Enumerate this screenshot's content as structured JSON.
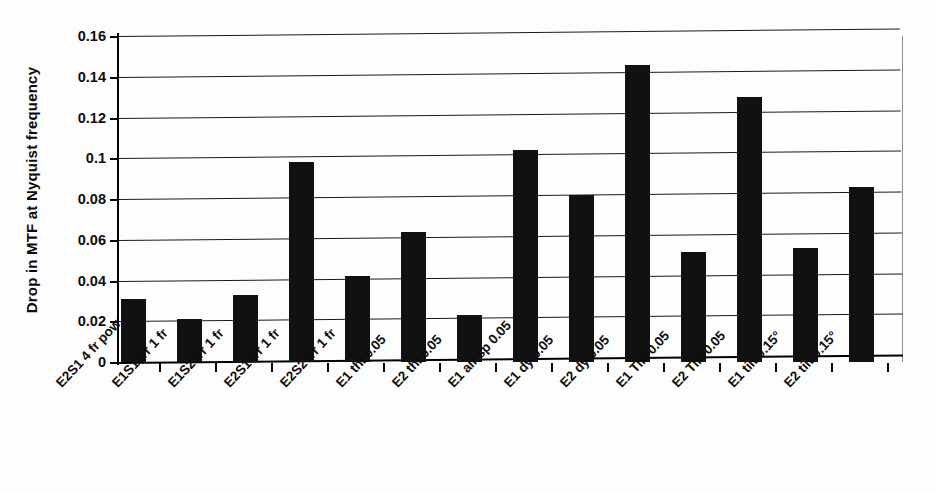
{
  "chart_data": {
    "type": "bar",
    "title": "",
    "xlabel": "",
    "ylabel": "Drop in MTF at Nyquist frequency",
    "ylim": [
      0,
      0.16
    ],
    "ytick_labels": [
      "0.16",
      "0.14",
      "0.12",
      "0.1",
      "0.08",
      "0.06",
      "0.04",
      "0.02",
      "0"
    ],
    "ytick_values": [
      0.16,
      0.14,
      0.12,
      0.1,
      0.08,
      0.06,
      0.04,
      0.02,
      0
    ],
    "grid": true,
    "legend": "none",
    "bar_color": "#111111",
    "categories": [
      "E2S1 4 fr pow",
      "E1S1 irr 1 fr",
      "E1S2 irr 1 fr",
      "E2S1 irr 1 fr",
      "E2S2 irr 1 fr",
      "E1 thi 0.05",
      "E2 thi 0.05",
      "E1 air sp 0.05",
      "E1 dy 0.05",
      "E2 dy 0.05",
      "E1 TIR 0.05",
      "E2 TIR 0.05",
      "E1 tilt 0.15°",
      "E2 tilt 0.15°"
    ],
    "values": [
      0.031,
      0.021,
      0.033,
      0.098,
      0.042,
      0.064,
      0.023,
      0.104,
      0.082,
      0.146,
      0.054,
      0.13,
      0.056,
      0.086
    ]
  }
}
